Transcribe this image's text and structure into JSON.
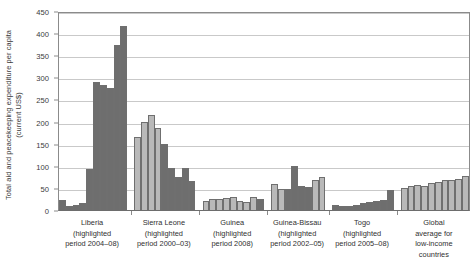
{
  "chart_data": {
    "type": "bar",
    "title": "",
    "xlabel": "",
    "ylabel": "Total aid and peacekeeping expenditure per capita\n(current US$)",
    "ylim": [
      0,
      450
    ],
    "ytick_labels": [
      "450",
      "400",
      "350",
      "300",
      "250",
      "200",
      "150",
      "100",
      "50",
      "0"
    ],
    "ytick_values": [
      450,
      400,
      350,
      300,
      250,
      200,
      150,
      100,
      50,
      0
    ],
    "grid": true,
    "legend": "none",
    "colors": {
      "normal_bar": "#b9b9b9",
      "highlighted_bar": "#6e6e6e",
      "gridline": "#c9c9c9",
      "axis": "#8b8b8b"
    },
    "groups": [
      {
        "name": "Liberia",
        "label": "Liberia\n(highlighted\nperiod 2004–08)",
        "highlighted_period": "2004–08",
        "values": [
          22,
          10,
          12,
          16,
          92,
          290,
          283,
          276,
          374,
          415
        ],
        "highlighted": [
          true,
          true,
          true,
          true,
          true,
          true,
          true,
          true,
          true,
          true
        ]
      },
      {
        "name": "Sierra Leone",
        "label": "Sierra Leone\n(highlighted\nperiod 2000–03)",
        "highlighted_period": "2000–03",
        "values": [
          165,
          200,
          215,
          185,
          150,
          95,
          75,
          95,
          65
        ],
        "highlighted": [
          false,
          false,
          false,
          false,
          true,
          true,
          true,
          true,
          true
        ]
      },
      {
        "name": "Guinea",
        "label": "Guinea\n(highlighted\nperiod 2008)",
        "highlighted_period": "2008",
        "values": [
          21,
          26,
          24,
          28,
          30,
          20,
          18,
          30,
          26
        ],
        "highlighted": [
          false,
          false,
          false,
          false,
          false,
          false,
          false,
          false,
          true
        ]
      },
      {
        "name": "Guinea-Bissau",
        "label": "Guinea-Bissau\n(highlighted\nperiod 2002–05)",
        "highlighted_period": "2002–05",
        "values": [
          58,
          48,
          48,
          100,
          55,
          52,
          68,
          75
        ],
        "highlighted": [
          false,
          false,
          true,
          true,
          true,
          true,
          false,
          false
        ]
      },
      {
        "name": "Togo",
        "label": "Togo\n(highlighted\nperiod 2005–08)",
        "highlighted_period": "2005–08",
        "values": [
          12,
          9,
          10,
          12,
          16,
          18,
          20,
          22,
          45
        ],
        "highlighted": [
          true,
          true,
          true,
          true,
          true,
          true,
          true,
          true,
          true
        ]
      },
      {
        "name": "Global average for low-income countries",
        "label": "Global\naverage for\nlow-income\ncountries",
        "highlighted_period": "",
        "values": [
          50,
          54,
          56,
          55,
          60,
          64,
          68,
          68,
          70,
          78
        ],
        "highlighted": [
          false,
          false,
          false,
          false,
          false,
          false,
          false,
          false,
          false,
          false
        ]
      }
    ]
  }
}
